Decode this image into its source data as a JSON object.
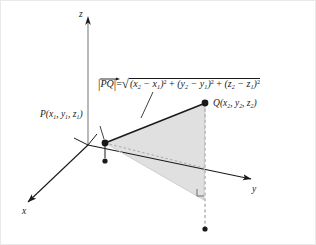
{
  "figure": {
    "type": "3d-coordinate-distance-diagram",
    "background_color": "#ffffff",
    "line_color": "#1a1a1a",
    "fill_color": "#dcdcdc",
    "dash_color": "#9a9a9a",
    "axes": {
      "x_label": "x",
      "y_label": "y",
      "z_label": "z"
    },
    "points": {
      "p_label_main": "P",
      "p_label_coords": "(x1, y1, z1)",
      "q_label_main": "Q",
      "q_label_coords": "(x2, y2, z2)"
    },
    "formula": {
      "lhs_bar_left": "|",
      "lhs_vector": "PQ",
      "lhs_bar_right": "|",
      "equals": "=",
      "sqrt_glyph": "√",
      "term1_open": "(x",
      "term1_sub_a": "2",
      "term1_minus": " − x",
      "term1_sub_b": "1",
      "term1_close": ")",
      "term1_sup": "2",
      "plus1": " + ",
      "term2_open": "(y",
      "term2_sub_a": "2",
      "term2_minus": " − y",
      "term2_sub_b": "1",
      "term2_close": ")",
      "term2_sup": "2",
      "plus2": " + ",
      "term3_open": "(z",
      "term3_sub_a": "2",
      "term3_minus": " − z",
      "term3_sub_b": "1",
      "term3_close": ")",
      "term3_sup": "2",
      "plain_text": "|PQ| = √((x2 − x1)² + (y2 − y1)² + (z2 − z1)²)"
    },
    "annotations": {
      "right_angle_marker": "right-angle"
    }
  }
}
